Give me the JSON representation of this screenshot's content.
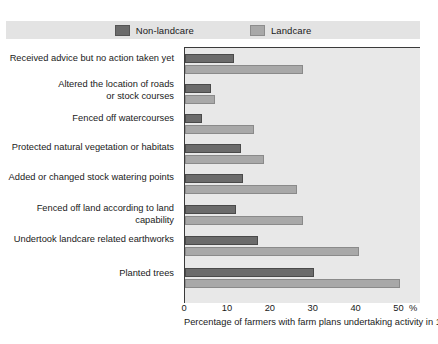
{
  "chart_data": {
    "type": "bar",
    "orientation": "horizontal",
    "title": "",
    "xlabel": "Percentage of farmers with farm plans undertaking activity in 1992-93",
    "ylabel": "",
    "xlim": [
      0,
      55
    ],
    "x_unit": "%",
    "xticks": [
      0,
      10,
      20,
      30,
      40,
      50
    ],
    "xtick_labels": [
      "0",
      "10",
      "20",
      "30",
      "40",
      "50"
    ],
    "grid": false,
    "legend_position": "top",
    "categories": [
      "Received advice but no action taken yet",
      "Altered the location of roads\nor stock courses",
      "Fenced off watercourses",
      "Protected natural vegetation or habitats",
      "Added or changed stock watering points",
      "Fenced off land according to land capability",
      "Undertook landcare related earthworks",
      "Planted trees"
    ],
    "series": [
      {
        "name": "Non-landcare",
        "color": "#6b6b6b",
        "values": [
          11.5,
          6,
          4,
          13,
          13.5,
          12,
          17,
          30
        ]
      },
      {
        "name": "Landcare",
        "color": "#a8a8a8",
        "values": [
          27.5,
          7,
          16,
          18.5,
          26,
          27.5,
          40.5,
          50
        ]
      }
    ]
  },
  "legend": {
    "items": [
      {
        "label": "Non-landcare",
        "swatch": "dark"
      },
      {
        "label": "Landcare",
        "swatch": "light"
      }
    ]
  },
  "axis": {
    "unit_label": "%",
    "caption": "Percentage of farmers with farm plans undertaking activity in 1992-93"
  }
}
